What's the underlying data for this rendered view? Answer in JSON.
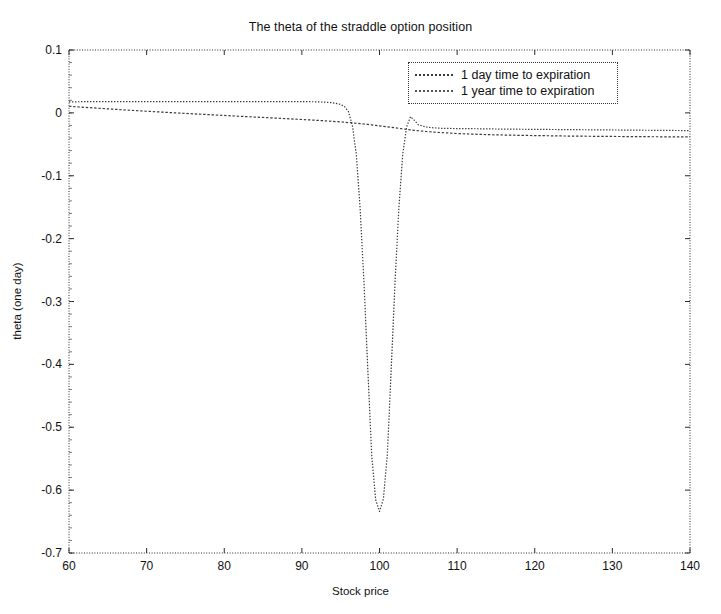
{
  "chart_data": {
    "type": "line",
    "title": "The theta of the straddle option position",
    "xlabel": "Stock price",
    "ylabel": "theta (one day)",
    "xlim": [
      60,
      140
    ],
    "ylim": [
      -0.7,
      0.1
    ],
    "xticks": [
      60,
      70,
      80,
      90,
      100,
      110,
      120,
      130,
      140
    ],
    "yticks": [
      0.1,
      0,
      -0.1,
      -0.2,
      -0.3,
      -0.4,
      -0.5,
      -0.6,
      -0.7
    ],
    "xtick_labels": [
      "60",
      "70",
      "80",
      "90",
      "100",
      "110",
      "120",
      "130",
      "140"
    ],
    "ytick_labels": [
      "0.1",
      "0",
      "-0.1",
      "-0.2",
      "-0.3",
      "-0.4",
      "-0.5",
      "-0.6",
      "-0.7"
    ],
    "grid": false,
    "legend_position": "top-right",
    "line_color": "#3a3a3a",
    "x": [
      60,
      62,
      64,
      66,
      68,
      70,
      72,
      74,
      76,
      78,
      80,
      82,
      84,
      86,
      88,
      90,
      91,
      92,
      93,
      94,
      95,
      95.5,
      96,
      96.5,
      97,
      97.5,
      98,
      98.5,
      99,
      99.5,
      100,
      100.5,
      101,
      101.5,
      102,
      102.5,
      103,
      103.5,
      104,
      104.5,
      105,
      106,
      107,
      108,
      110,
      112,
      114,
      116,
      118,
      120,
      124,
      128,
      132,
      136,
      140
    ],
    "series": [
      {
        "name": "1 day time to expiration",
        "style": "dotted",
        "values": [
          0.0175,
          0.0178,
          0.018,
          0.018,
          0.018,
          0.018,
          0.018,
          0.018,
          0.018,
          0.018,
          0.018,
          0.018,
          0.018,
          0.018,
          0.018,
          0.018,
          0.0178,
          0.0175,
          0.017,
          0.016,
          0.0135,
          0.01,
          0.002,
          -0.02,
          -0.065,
          -0.15,
          -0.27,
          -0.41,
          -0.545,
          -0.615,
          -0.634,
          -0.614,
          -0.545,
          -0.41,
          -0.27,
          -0.15,
          -0.065,
          -0.022,
          -0.006,
          -0.012,
          -0.019,
          -0.0225,
          -0.0238,
          -0.0245,
          -0.025,
          -0.0252,
          -0.0255,
          -0.0258,
          -0.026,
          -0.0262,
          -0.0266,
          -0.027,
          -0.0274,
          -0.0278,
          -0.0282
        ]
      },
      {
        "name": "1 year time to expiration",
        "style": "dashed",
        "values": [
          0.0105,
          0.0088,
          0.0072,
          0.0056,
          0.0041,
          0.0026,
          0.0012,
          -0.0002,
          -0.0015,
          -0.0028,
          -0.0041,
          -0.0054,
          -0.0067,
          -0.0079,
          -0.0092,
          -0.0105,
          -0.0112,
          -0.0119,
          -0.0127,
          -0.0135,
          -0.0144,
          -0.0149,
          -0.0154,
          -0.0159,
          -0.0165,
          -0.0171,
          -0.0177,
          -0.0184,
          -0.0191,
          -0.0198,
          -0.0206,
          -0.0214,
          -0.0222,
          -0.023,
          -0.0238,
          -0.0246,
          -0.0254,
          -0.0262,
          -0.027,
          -0.0277,
          -0.0284,
          -0.0296,
          -0.0306,
          -0.0314,
          -0.0328,
          -0.0338,
          -0.0346,
          -0.0352,
          -0.0357,
          -0.0361,
          -0.0368,
          -0.0373,
          -0.0377,
          -0.038,
          -0.0383
        ]
      }
    ],
    "annotations": {
      "minimum_x": 100,
      "minimum_y": -0.634
    }
  },
  "legend": {
    "items": [
      {
        "label": "1 day time to expiration"
      },
      {
        "label": "1 year time to expiration"
      }
    ]
  }
}
